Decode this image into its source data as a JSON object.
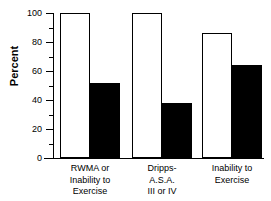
{
  "chart_data": {
    "type": "bar",
    "title": "",
    "subtitle": "",
    "xlabel": "",
    "ylabel": "Percent",
    "ylim": [
      0,
      100
    ],
    "xlim_categories": 3,
    "grid": false,
    "legend": false,
    "legend_position": "none",
    "orientation": "vertical",
    "grouped": true,
    "categories": [
      "RWMA or\nInability to\nExercise",
      "Dripps-\nA.S.A.\nIII or IV",
      "Inability to\nExercise"
    ],
    "series": [
      {
        "name": "open-bar",
        "fill": "#ffffff",
        "edge": "#000000",
        "values": [
          100,
          100,
          86
        ]
      },
      {
        "name": "filled-bar",
        "fill": "#000000",
        "edge": "#000000",
        "values": [
          52,
          38,
          64
        ]
      }
    ],
    "yticks": [
      0,
      20,
      40,
      60,
      80,
      100
    ],
    "ytick_labels": [
      "0",
      "20",
      "40",
      "60",
      "80",
      "100"
    ],
    "yminor_ticks": [
      10,
      30,
      50,
      70,
      90
    ],
    "annotations": []
  },
  "axis": {
    "y_title": "Percent",
    "tick_labels": [
      "100",
      "80",
      "60",
      "40",
      "20",
      "0"
    ]
  },
  "colors": {
    "background": "#ffffff",
    "axis": "#000000",
    "open_bar_fill": "#ffffff",
    "filled_bar_fill": "#000000",
    "text": "#000000"
  }
}
